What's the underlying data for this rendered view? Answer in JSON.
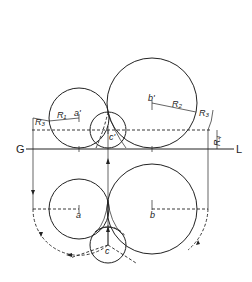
{
  "diagram": {
    "type": "orthographic-projection",
    "reference_line": {
      "left_label": "G",
      "right_label": "L"
    },
    "front_view": {
      "labels": {
        "a": "a'",
        "b": "b'",
        "c": "c'"
      },
      "radii": {
        "r1": "R₁",
        "r2": "R₂",
        "r3": "R₃",
        "r4": "R₄"
      }
    },
    "top_view": {
      "labels": {
        "a": "a",
        "b": "b",
        "c": "c"
      }
    },
    "colors": {
      "line": "#222222",
      "background": "#ffffff"
    }
  }
}
